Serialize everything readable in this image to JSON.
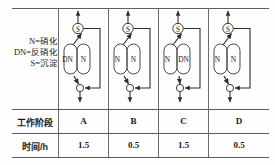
{
  "legend": {
    "lines": [
      "N=硝化",
      "DN=反硝化",
      "S=沉淀"
    ]
  },
  "table": {
    "row_labels": {
      "phase": "工作阶段",
      "time": "时间/h"
    },
    "phases": [
      "A",
      "B",
      "C",
      "D"
    ],
    "times": [
      "1.5",
      "0.5",
      "1.5",
      "0.5"
    ]
  },
  "diagrams": [
    {
      "phase": "A",
      "settler_label": "S",
      "tank_left_label": "DN",
      "tank_right_label": "N"
    },
    {
      "phase": "B",
      "settler_label": "S",
      "tank_left_label": "N",
      "tank_right_label": "N"
    },
    {
      "phase": "C",
      "settler_label": "S",
      "tank_left_label": "N",
      "tank_right_label": "DN"
    },
    {
      "phase": "D",
      "settler_label": "S",
      "tank_left_label": "N",
      "tank_right_label": "N"
    }
  ],
  "colors": {
    "line": "#3d3d3d",
    "rule": "#5d5d5d",
    "text": "#1a1a1a",
    "background": "#fefefe"
  }
}
